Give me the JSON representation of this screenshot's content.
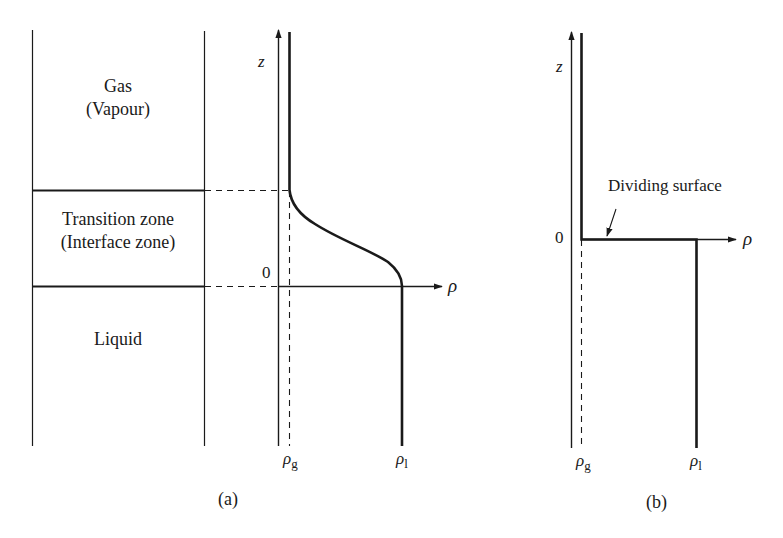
{
  "figure": {
    "panel_a": {
      "caption": "(a)",
      "zones": {
        "gas": [
          "Gas",
          "(Vapour)"
        ],
        "transition": [
          "Transition zone",
          "(Interface zone)"
        ],
        "liquid": "Liquid"
      },
      "axes": {
        "z_label": "z",
        "rho_label": "ρ",
        "origin_label": "0",
        "rho_g_label": "ρ",
        "rho_g_sub": "g",
        "rho_l_label": "ρ",
        "rho_l_sub": "l"
      },
      "profile": "continuous density profile: ρ_g above transition zone, smooth decrease through interface zone, ρ_l below z=0"
    },
    "panel_b": {
      "caption": "(b)",
      "annotation": "Dividing surface",
      "axes": {
        "z_label": "z",
        "rho_label": "ρ",
        "origin_label": "0",
        "rho_g_label": "ρ",
        "rho_g_sub": "g",
        "rho_l_label": "ρ",
        "rho_l_sub": "l"
      },
      "profile": "step density profile: ρ_g above z=0, jumps to ρ_l at dividing surface"
    },
    "colors": {
      "ink": "#1a1a1a",
      "background": "#ffffff"
    }
  }
}
